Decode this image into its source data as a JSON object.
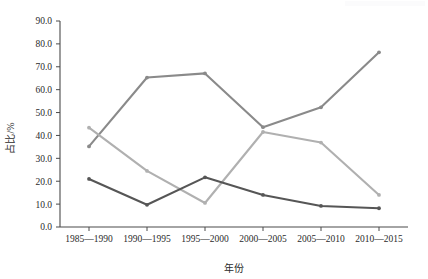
{
  "chart_data": {
    "type": "line",
    "title": "",
    "xlabel": "年份",
    "ylabel": "占比/%",
    "categories": [
      "1985—1990",
      "1990—1995",
      "1995—2000",
      "2000—2005",
      "2005—2010",
      "2010—2015"
    ],
    "ylim": [
      0.0,
      90.0
    ],
    "ytick_labels": [
      "90.0",
      "80.0",
      "70.0",
      "60.0",
      "50.0",
      "40.0",
      "30.0",
      "20.0",
      "10.0",
      "0.0"
    ],
    "ytick_values": [
      90.0,
      80.0,
      70.0,
      60.0,
      50.0,
      40.0,
      30.0,
      20.0,
      10.0,
      0.0
    ],
    "ytick_step": 10.0,
    "grid": false,
    "legend": "none",
    "series": [
      {
        "name": "series-medium-gray",
        "color": "#8a8a8a",
        "values": [
          35.2,
          65.3,
          67.1,
          43.6,
          52.3,
          76.3
        ]
      },
      {
        "name": "series-light-gray",
        "color": "#b0b0b0",
        "values": [
          43.4,
          24.5,
          10.5,
          41.5,
          36.9,
          14.0
        ]
      },
      {
        "name": "series-dark-gray",
        "color": "#565656",
        "values": [
          21.0,
          9.7,
          21.7,
          14.0,
          9.2,
          8.2
        ]
      }
    ]
  },
  "figure": {
    "background": "#ffffff",
    "axis_color": "#4a4a4a",
    "text_color": "#2b2b2b"
  }
}
